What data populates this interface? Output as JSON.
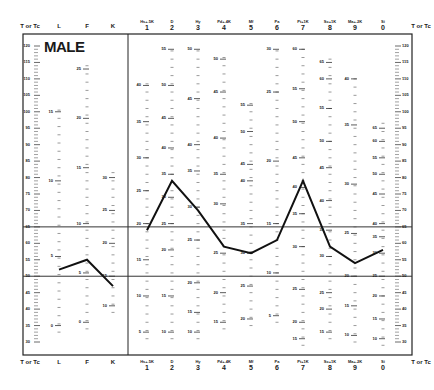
{
  "form": {
    "gender_label": "MALE",
    "left_axis_title": "T or Tc",
    "right_axis_title": "T or Tc"
  },
  "validity_scales": [
    {
      "label": "L"
    },
    {
      "label": "F"
    },
    {
      "label": "K"
    }
  ],
  "clinical_scales": [
    {
      "abbr": "Hs+.5K",
      "number": "1"
    },
    {
      "abbr": "D",
      "number": "2"
    },
    {
      "abbr": "Hy",
      "number": "3"
    },
    {
      "abbr": "Pd+.4K",
      "number": "4"
    },
    {
      "abbr": "Mf",
      "number": "5"
    },
    {
      "abbr": "Pa",
      "number": "6"
    },
    {
      "abbr": "Pt+1K",
      "number": "7"
    },
    {
      "abbr": "Sc+1K",
      "number": "8"
    },
    {
      "abbr": "Ma+.2K",
      "number": "9"
    },
    {
      "abbr": "Si",
      "number": "0"
    }
  ],
  "t_axis_ticks": [
    "120",
    "115",
    "110",
    "105",
    "100",
    "95",
    "90",
    "85",
    "80",
    "75",
    "70",
    "65",
    "60",
    "55",
    "50",
    "45",
    "40",
    "35",
    "30"
  ],
  "chart_data": {
    "type": "line",
    "xlabel": "Scale",
    "ylabel": "T or Tc",
    "ylim": [
      30,
      120
    ],
    "reference_lines": [
      65,
      50
    ],
    "grid": false,
    "legend": null,
    "series": [
      {
        "name": "Validity profile",
        "categories": [
          "L",
          "F",
          "K"
        ],
        "values": [
          52,
          55,
          47
        ]
      },
      {
        "name": "Clinical profile",
        "categories": [
          "Hs+.5K 1",
          "D 2",
          "Hy 3",
          "Pd+.4K 4",
          "Mf 5",
          "Pa 6",
          "Pt+1K 7",
          "Sc+1K 8",
          "Ma+.2K 9",
          "Si 0"
        ],
        "values": [
          64,
          79,
          70,
          59,
          57,
          61,
          79,
          59,
          54,
          58
        ]
      }
    ],
    "raw_score_labels": {
      "L": [
        [
          "15",
          100
        ],
        [
          "10",
          79
        ],
        [
          "5",
          56
        ],
        [
          "0",
          35
        ]
      ],
      "F": [
        [
          "25",
          113
        ],
        [
          "20",
          98
        ],
        [
          "15",
          83
        ],
        [
          "10",
          66
        ],
        [
          "5",
          51
        ],
        [
          "0",
          36
        ]
      ],
      "K": [
        [
          "30",
          80
        ],
        [
          "25",
          70
        ],
        [
          "20",
          60
        ],
        [
          "15",
          50
        ],
        [
          "10",
          41
        ]
      ],
      "1": [
        [
          "40",
          108
        ],
        [
          "35",
          97
        ],
        [
          "30",
          86
        ],
        [
          "25",
          76
        ],
        [
          "20",
          66
        ],
        [
          "15",
          55
        ],
        [
          "10",
          44
        ],
        [
          "5",
          33
        ]
      ],
      "2": [
        [
          "55",
          119
        ],
        [
          "50",
          108
        ],
        [
          "45",
          98
        ],
        [
          "40",
          89
        ],
        [
          "35",
          81
        ],
        [
          "30",
          74
        ],
        [
          "25",
          66
        ],
        [
          "20",
          58
        ],
        [
          "15",
          44
        ],
        [
          "10",
          33
        ]
      ],
      "3": [
        [
          "50",
          119
        ],
        [
          "45",
          104
        ],
        [
          "40",
          90
        ],
        [
          "35",
          82
        ],
        [
          "30",
          71
        ],
        [
          "25",
          61
        ],
        [
          "20",
          48
        ],
        [
          "15",
          39
        ],
        [
          "10",
          33
        ]
      ],
      "4": [
        [
          "50",
          116
        ],
        [
          "45",
          106
        ],
        [
          "40",
          92
        ],
        [
          "35",
          81
        ],
        [
          "30",
          72
        ],
        [
          "25",
          57
        ],
        [
          "20",
          45
        ],
        [
          "15",
          36
        ]
      ],
      "5": [
        [
          "55",
          102
        ],
        [
          "50",
          94
        ],
        [
          "45",
          84
        ],
        [
          "40",
          79
        ],
        [
          "35",
          66
        ],
        [
          "30",
          57
        ],
        [
          "25",
          47
        ],
        [
          "20",
          37
        ]
      ],
      "6": [
        [
          "30",
          119
        ],
        [
          "25",
          106
        ],
        [
          "20",
          85
        ],
        [
          "15",
          66
        ],
        [
          "10",
          51
        ],
        [
          "5",
          38
        ]
      ],
      "7": [
        [
          "60",
          119
        ],
        [
          "55",
          107
        ],
        [
          "50",
          97
        ],
        [
          "45",
          86
        ],
        [
          "40",
          77
        ],
        [
          "35",
          69
        ],
        [
          "30",
          59
        ],
        [
          "25",
          46
        ],
        [
          "20",
          36
        ],
        [
          "15",
          31
        ]
      ],
      "8": [
        [
          "65",
          115
        ],
        [
          "60",
          110
        ],
        [
          "55",
          101
        ],
        [
          "50",
          91
        ],
        [
          "45",
          83
        ],
        [
          "40",
          73
        ],
        [
          "35",
          64
        ],
        [
          "30",
          56
        ],
        [
          "25",
          45
        ],
        [
          "20",
          40
        ],
        [
          "15",
          33
        ]
      ],
      "9": [
        [
          "40",
          110
        ],
        [
          "35",
          96
        ],
        [
          "30",
          78
        ],
        [
          "25",
          63
        ],
        [
          "20",
          50
        ],
        [
          "15",
          41
        ],
        [
          "10",
          32
        ]
      ],
      "0": [
        [
          "65",
          95
        ],
        [
          "60",
          91
        ],
        [
          "55",
          86
        ],
        [
          "50",
          81
        ],
        [
          "45",
          75
        ],
        [
          "40",
          66
        ],
        [
          "35",
          62
        ],
        [
          "30",
          57
        ],
        [
          "25",
          50
        ],
        [
          "20",
          44
        ],
        [
          "15",
          37
        ],
        [
          "10",
          31
        ]
      ]
    }
  }
}
